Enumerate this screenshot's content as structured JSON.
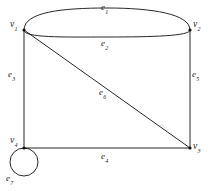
{
  "figure": {
    "kind": "undirected-multigraph-diagram",
    "background_color": "#ffffff",
    "stroke_color": "#101010",
    "text_color": "#1a1a1a"
  },
  "vertices": [
    {
      "id": "v1",
      "name": "v",
      "index": "1",
      "x": 24,
      "y": 30
    },
    {
      "id": "v2",
      "name": "v",
      "index": "2",
      "x": 190,
      "y": 30
    },
    {
      "id": "v3",
      "name": "v",
      "index": "3",
      "x": 190,
      "y": 148
    },
    {
      "id": "v4",
      "name": "v",
      "index": "4",
      "x": 24,
      "y": 148
    }
  ],
  "edges": [
    {
      "id": "e1",
      "name": "e",
      "index": "1",
      "from": "v1",
      "to": "v2",
      "shape": "arc-upper",
      "label_x": 101,
      "label_y": 3
    },
    {
      "id": "e2",
      "name": "e",
      "index": "2",
      "from": "v1",
      "to": "v2",
      "shape": "arc-lower",
      "label_x": 101,
      "label_y": 39
    },
    {
      "id": "e3",
      "name": "e",
      "index": "3",
      "from": "v1",
      "to": "v4",
      "shape": "line",
      "label_x": 8,
      "label_y": 70
    },
    {
      "id": "e4",
      "name": "e",
      "index": "4",
      "from": "v4",
      "to": "v3",
      "shape": "line",
      "label_x": 101,
      "label_y": 152
    },
    {
      "id": "e5",
      "name": "e",
      "index": "5",
      "from": "v2",
      "to": "v3",
      "shape": "line",
      "label_x": 192,
      "label_y": 70
    },
    {
      "id": "e6",
      "name": "e",
      "index": "6",
      "from": "v1",
      "to": "v3",
      "shape": "diagonal",
      "label_x": 99,
      "label_y": 88
    },
    {
      "id": "e7",
      "name": "e",
      "index": "7",
      "from": "v4",
      "to": "v4",
      "shape": "self-loop",
      "label_x": 6,
      "label_y": 174
    }
  ],
  "vertex_labels": [
    {
      "id": "v1-label",
      "name": "v",
      "index": "1",
      "x": 10,
      "y": 20
    },
    {
      "id": "v2-label",
      "name": "v",
      "index": "2",
      "x": 193,
      "y": 20
    },
    {
      "id": "v3-label",
      "name": "v",
      "index": "3",
      "x": 193,
      "y": 142
    },
    {
      "id": "v4-label",
      "name": "v",
      "index": "4",
      "x": 10,
      "y": 136
    }
  ]
}
